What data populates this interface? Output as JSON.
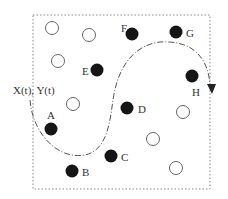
{
  "diagram": {
    "path_label": "X(t), Y(t)",
    "colors": {
      "filled": "#151515",
      "stroke": "#555555",
      "border": "#888888",
      "text": "#333333"
    },
    "filled_nodes": [
      {
        "label": "F",
        "cx": 132,
        "cy": 34
      },
      {
        "label": "G",
        "cx": 176,
        "cy": 32
      },
      {
        "label": "E",
        "cx": 97,
        "cy": 70
      },
      {
        "label": "H",
        "cx": 192,
        "cy": 76
      },
      {
        "label": "D",
        "cx": 127,
        "cy": 108
      },
      {
        "label": "A",
        "cx": 51,
        "cy": 129
      },
      {
        "label": "C",
        "cx": 111,
        "cy": 156
      },
      {
        "label": "B",
        "cx": 72,
        "cy": 171
      }
    ],
    "open_nodes": [
      {
        "cx": 52,
        "cy": 28
      },
      {
        "cx": 89,
        "cy": 35
      },
      {
        "cx": 58,
        "cy": 61
      },
      {
        "cx": 73,
        "cy": 104
      },
      {
        "cx": 183,
        "cy": 112
      },
      {
        "cx": 153,
        "cy": 139
      },
      {
        "cx": 176,
        "cy": 168
      }
    ]
  }
}
